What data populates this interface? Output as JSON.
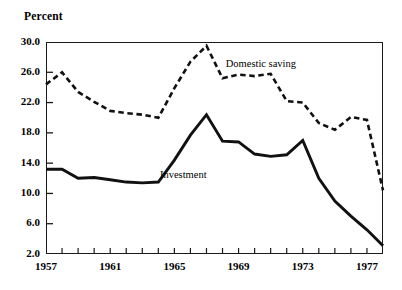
{
  "chart_data": {
    "type": "line",
    "title": "",
    "xlabel": "",
    "ylabel": "Percent",
    "ylim": [
      2.0,
      30.0
    ],
    "xlim": [
      1957,
      1978
    ],
    "grid": false,
    "legend_position": "inline-annotation",
    "y_ticks": [
      "2.0",
      "6.0",
      "10.0",
      "14.0",
      "18.0",
      "22.0",
      "26.0",
      "30.0"
    ],
    "y_tick_values": [
      2.0,
      6.0,
      10.0,
      14.0,
      18.0,
      22.0,
      26.0,
      30.0
    ],
    "x_ticks": [
      "1957",
      "1961",
      "1965",
      "1969",
      "1973",
      "1977"
    ],
    "x_tick_values": [
      1957,
      1961,
      1965,
      1969,
      1973,
      1977
    ],
    "x_minor_tick_values": [
      1957,
      1958,
      1959,
      1960,
      1961,
      1962,
      1963,
      1964,
      1965,
      1966,
      1967,
      1968,
      1969,
      1970,
      1971,
      1972,
      1973,
      1974,
      1975,
      1976,
      1977,
      1978
    ],
    "x": [
      1957,
      1958,
      1959,
      1960,
      1961,
      1962,
      1963,
      1964,
      1965,
      1966,
      1967,
      1968,
      1969,
      1970,
      1971,
      1972,
      1973,
      1974,
      1975,
      1976,
      1977,
      1978
    ],
    "series": [
      {
        "name": "Domestic saving",
        "style": "dashed",
        "color": "#111111",
        "values": [
          24.4,
          26.0,
          23.4,
          22.1,
          20.9,
          20.6,
          20.4,
          20.0,
          23.9,
          27.4,
          29.5,
          25.2,
          25.7,
          25.5,
          25.8,
          22.2,
          22.0,
          19.3,
          18.4,
          20.1,
          19.7,
          10.4
        ]
      },
      {
        "name": "Investment",
        "style": "solid",
        "color": "#111111",
        "values": [
          13.2,
          13.2,
          12.0,
          12.1,
          11.8,
          11.5,
          11.4,
          11.5,
          14.4,
          17.7,
          20.4,
          16.9,
          16.8,
          15.2,
          14.9,
          15.1,
          17.0,
          12.0,
          9.0,
          7.0,
          5.2,
          3.1
        ]
      }
    ],
    "annotations": [
      {
        "text": "Domestic saving",
        "x": 1968.2,
        "y": 27.0
      },
      {
        "text": "Investment",
        "x": 1964.1,
        "y": 12.3
      }
    ]
  },
  "colors": {
    "axis": "#1a1a1a",
    "line": "#111111",
    "background": "#ffffff"
  }
}
